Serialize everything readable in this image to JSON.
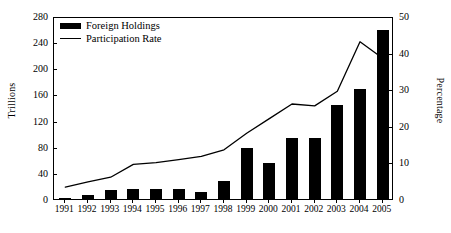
{
  "chart_data": {
    "type": "bar",
    "title": "",
    "xlabel": "",
    "ylabel": "Trillions",
    "ylabel_right": "Percentage",
    "categories": [
      "1991",
      "1992",
      "1993",
      "1994",
      "1995",
      "1996",
      "1997",
      "1998",
      "1999",
      "2000",
      "2001",
      "2002",
      "2003",
      "2004",
      "2005"
    ],
    "ylim": [
      0,
      280
    ],
    "ylim_right": [
      0,
      50
    ],
    "yticks": [
      0,
      40,
      80,
      120,
      160,
      200,
      240,
      280
    ],
    "yticks_right": [
      0,
      10,
      20,
      30,
      40,
      50
    ],
    "grid": false,
    "legend_position": "top-left",
    "series": [
      {
        "name": "Foreign Holdings",
        "type": "bar",
        "axis": "left",
        "unit": "Trillions",
        "color": "#000000",
        "values": [
          2,
          6,
          14,
          16,
          16,
          16,
          11,
          27,
          78,
          55,
          93,
          93,
          144,
          168,
          259
        ]
      },
      {
        "name": "Participation Rate",
        "type": "line",
        "axis": "right",
        "unit": "Percentage",
        "color": "#000000",
        "values": [
          3.8,
          5.2,
          6.5,
          10.0,
          10.5,
          11.3,
          12.2,
          14.0,
          18.5,
          22.5,
          26.5,
          26.0,
          30.0,
          43.5,
          39.0
        ]
      }
    ],
    "legend": [
      {
        "label": "Foreign Holdings",
        "marker": "bar-swatch"
      },
      {
        "label": "Participation Rate",
        "marker": "line-swatch"
      }
    ]
  }
}
